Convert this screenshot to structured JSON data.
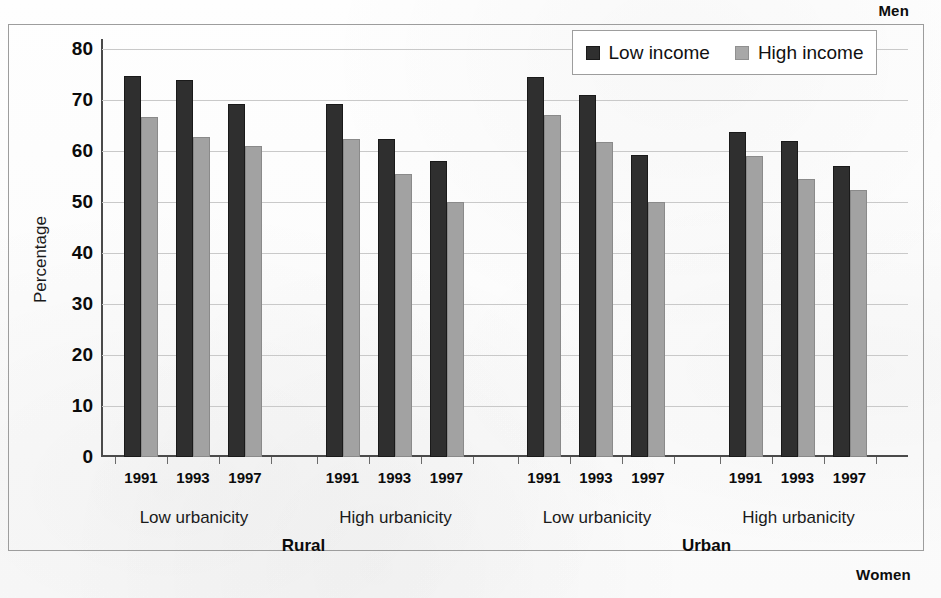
{
  "corners": {
    "men": "Men",
    "women": "Women"
  },
  "legend": {
    "position": "top-right",
    "items": [
      {
        "label": "Low income",
        "color": "#2f2f2f"
      },
      {
        "label": "High income",
        "color": "#a8a8a8"
      }
    ]
  },
  "axes": {
    "ylabel": "Percentage",
    "yticks": [
      "80",
      "70",
      "60",
      "50",
      "40",
      "30",
      "20",
      "10",
      "0"
    ]
  },
  "groups": [
    {
      "region": "Rural",
      "urbanicity": "Low urbanicity",
      "years": [
        "1991",
        "1993",
        "1997"
      ]
    },
    {
      "region": "Rural",
      "urbanicity": "High urbanicity",
      "years": [
        "1991",
        "1993",
        "1997"
      ]
    },
    {
      "region": "Urban",
      "urbanicity": "Low urbanicity",
      "years": [
        "1991",
        "1993",
        "1997"
      ]
    },
    {
      "region": "Urban",
      "urbanicity": "High urbanicity",
      "years": [
        "1991",
        "1993",
        "1997"
      ]
    }
  ],
  "regions": [
    {
      "label": "Rural"
    },
    {
      "label": "Urban"
    }
  ],
  "chart_data": {
    "type": "bar",
    "title": "",
    "xlabel": "",
    "ylabel": "Percentage",
    "ylim": [
      0,
      80
    ],
    "ytick_step": 10,
    "grid": true,
    "legend_position": "top-right",
    "annotations": [
      "Men",
      "Women"
    ],
    "group_hierarchy": [
      "region",
      "urbanicity",
      "year"
    ],
    "categories": [
      "Rural / Low urbanicity / 1991",
      "Rural / Low urbanicity / 1993",
      "Rural / Low urbanicity / 1997",
      "Rural / High urbanicity / 1991",
      "Rural / High urbanicity / 1993",
      "Rural / High urbanicity / 1997",
      "Urban / Low urbanicity / 1991",
      "Urban / Low urbanicity / 1993",
      "Urban / Low urbanicity / 1997",
      "Urban / High urbanicity / 1991",
      "Urban / High urbanicity / 1993",
      "Urban / High urbanicity / 1997"
    ],
    "series": [
      {
        "name": "Low income",
        "color": "#2f2f2f",
        "values": [
          74.8,
          74.0,
          69.3,
          69.3,
          62.4,
          58.0,
          74.6,
          71.0,
          59.2,
          63.8,
          62.0,
          57.0
        ]
      },
      {
        "name": "High income",
        "color": "#a8a8a8",
        "values": [
          66.6,
          62.8,
          61.0,
          62.3,
          55.5,
          50.0,
          67.0,
          61.7,
          50.0,
          59.0,
          54.5,
          52.3
        ]
      }
    ]
  }
}
